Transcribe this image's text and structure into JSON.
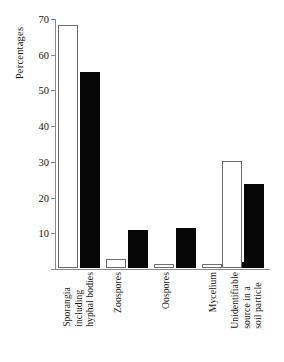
{
  "chart_data": {
    "type": "bar",
    "title": "",
    "xlabel": "",
    "ylabel": "Percentages",
    "ylim": [
      0,
      70
    ],
    "yticks": [
      0,
      10,
      20,
      30,
      40,
      50,
      60,
      70
    ],
    "ytick_labels": [
      "",
      "10",
      "20",
      "30",
      "40",
      "50",
      "60",
      "70"
    ],
    "grid": false,
    "legend": "none",
    "categories": [
      "Sporangia including hyphal bodies",
      "Zoospores",
      "Oospores",
      "Mycelium",
      "Unidentifiable source in a soil particle"
    ],
    "category_lines": [
      [
        "Sporangia",
        "including",
        "hyphal bodies"
      ],
      [
        "Zoospores"
      ],
      [
        "Oospores"
      ],
      [
        "Mycelium"
      ],
      [
        "Unidentifiable",
        "source in a",
        "soil particle"
      ]
    ],
    "series": [
      {
        "name": "open",
        "fill": "#ffffff",
        "edge": "#6e6e6e",
        "values": [
          68,
          2.5,
          1,
          1,
          30
        ]
      },
      {
        "name": "filled",
        "fill": "#070707",
        "edge": "#070707",
        "values": [
          55,
          10.7,
          11.2,
          1.8,
          23.5
        ]
      }
    ]
  },
  "axis": {
    "y_title": "Percentages"
  }
}
